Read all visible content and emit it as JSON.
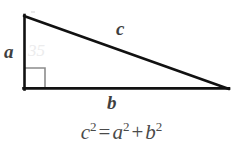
{
  "figure": {
    "background_color": "#ffffff",
    "stroke_color": "#111111",
    "label_color": "#3f3f3f",
    "right_angle_color": "#8c8c8c",
    "triangle": {
      "apex": {
        "x": 24,
        "y": 16
      },
      "bottom_left": {
        "x": 24,
        "y": 89
      },
      "bottom_right": {
        "x": 228,
        "y": 89
      },
      "stroke_width": 2.6
    },
    "right_angle_marker": {
      "vertex": {
        "x": 24,
        "y": 89
      },
      "size": 21,
      "stroke_width": 1.6
    },
    "labels": {
      "vertical_leg": "a",
      "hypotenuse": "c",
      "horizontal_leg": "b"
    },
    "artifact_text": "35"
  },
  "equation": {
    "lhs_base": "c",
    "lhs_exp": "2",
    "equals": "=",
    "term1_base": "a",
    "term1_exp": "2",
    "plus": "+",
    "term2_base": "b",
    "term2_exp": "2",
    "plain": "c² = a² + b²"
  }
}
